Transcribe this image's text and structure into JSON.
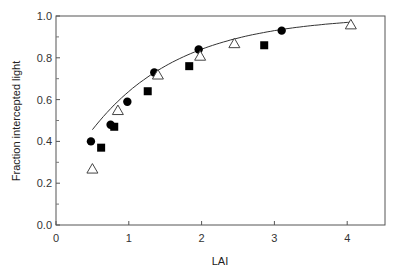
{
  "chart_data": {
    "type": "scatter",
    "title": "",
    "xlabel": "LAI",
    "ylabel": "Fraction intercepted light",
    "xlim": [
      0,
      4.5
    ],
    "ylim": [
      0.0,
      1.0
    ],
    "xticks": [
      0,
      1,
      2,
      3,
      4
    ],
    "yticks": [
      0.0,
      0.2,
      0.4,
      0.6,
      0.8,
      1.0
    ],
    "ytick_labels": [
      "0.0",
      "0.2",
      "0.4",
      "0.6",
      "0.8",
      "1.0"
    ],
    "grid": false,
    "legend": null,
    "series": [
      {
        "name": "circles",
        "marker": "filled-circle",
        "x": [
          0.48,
          0.75,
          0.98,
          1.35,
          1.96,
          3.1
        ],
        "y": [
          0.4,
          0.48,
          0.59,
          0.73,
          0.84,
          0.93
        ]
      },
      {
        "name": "squares",
        "marker": "filled-square",
        "x": [
          0.62,
          0.8,
          1.26,
          1.83,
          2.86
        ],
        "y": [
          0.37,
          0.47,
          0.64,
          0.76,
          0.86
        ]
      },
      {
        "name": "triangles",
        "marker": "open-triangle",
        "x": [
          0.5,
          0.85,
          1.4,
          1.98,
          2.45,
          4.05
        ],
        "y": [
          0.27,
          0.55,
          0.72,
          0.81,
          0.87,
          0.96
        ]
      },
      {
        "name": "fit",
        "marker": "line",
        "x": [
          0.5,
          0.75,
          1.0,
          1.5,
          2.0,
          2.5,
          3.0,
          3.5,
          4.05
        ],
        "y": [
          0.33,
          0.45,
          0.55,
          0.69,
          0.79,
          0.86,
          0.91,
          0.94,
          0.97
        ]
      }
    ]
  }
}
